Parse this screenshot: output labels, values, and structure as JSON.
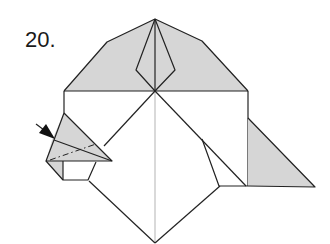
{
  "diagram": {
    "step_number": "20.",
    "type": "origami-fold-diagram",
    "colors": {
      "line": "#222222",
      "shaded_paper": "#d6d6d6",
      "background": "#ffffff",
      "center_crease": "#aaaaaa"
    },
    "symbols": [
      {
        "name": "push-arrow",
        "description": "black filled arrow pointing into left pocket (squash/reverse fold)"
      },
      {
        "name": "valley-fold-line",
        "description": "dash-dot line across left flap"
      }
    ]
  }
}
